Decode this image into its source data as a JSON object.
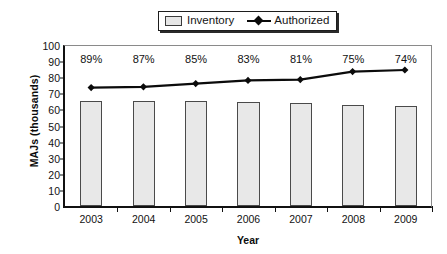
{
  "chart_data": {
    "type": "bar",
    "title": "",
    "xlabel": "Year",
    "ylabel": "MAJs (thousands)",
    "categories": [
      "2003",
      "2004",
      "2005",
      "2006",
      "2007",
      "2008",
      "2009"
    ],
    "ylim": [
      0,
      100
    ],
    "yticks": [
      0,
      10,
      20,
      30,
      40,
      50,
      60,
      70,
      80,
      90,
      100
    ],
    "ytick_labels": [
      "0",
      "10",
      "20",
      "30",
      "40",
      "50",
      "60",
      "70",
      "80",
      "90",
      "100"
    ],
    "grid": false,
    "legend_position": "top-center",
    "series": [
      {
        "name": "Inventory",
        "type": "bar",
        "values": [
          65,
          65,
          65,
          64.5,
          64,
          63,
          62
        ],
        "color": "#e8e8e8",
        "edge_color": "#4a4a4a"
      },
      {
        "name": "Authorized",
        "type": "line",
        "values": [
          74,
          74.5,
          76.5,
          78.5,
          79,
          84,
          85
        ],
        "color": "#0b0b0b",
        "marker": "diamond"
      }
    ],
    "annotations": {
      "label": "percent of authorized filled",
      "values": [
        "89%",
        "87%",
        "85%",
        "83%",
        "81%",
        "75%",
        "74%"
      ]
    }
  },
  "legend": {
    "items": [
      {
        "label": "Inventory",
        "swatch": "bar-swatch"
      },
      {
        "label": "Authorized",
        "swatch": "line-marker-swatch"
      }
    ]
  }
}
